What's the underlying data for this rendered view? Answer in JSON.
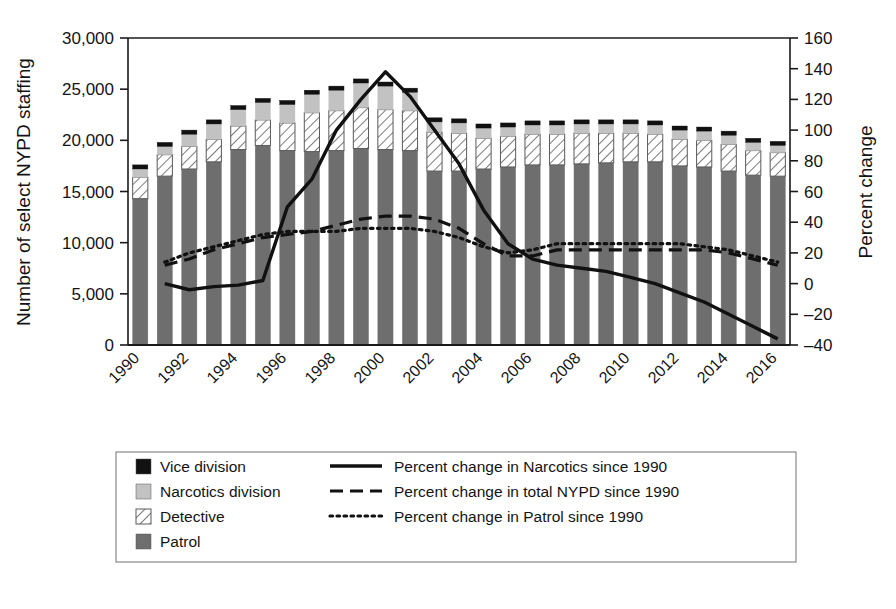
{
  "chart_data": {
    "type": "bar",
    "title": "",
    "subtitle": "",
    "ylabel": "Number of select NYPD staffing",
    "y2label": "Percent change",
    "xlabel": "",
    "ylim": [
      0,
      30000
    ],
    "ytick_values": [
      0,
      5000,
      10000,
      15000,
      20000,
      25000,
      30000
    ],
    "ytick_labels": [
      "0",
      "5,000",
      "10,000",
      "15,000",
      "20,000",
      "25,000",
      "30,000"
    ],
    "y2lim": [
      -40,
      160
    ],
    "y2tick_values": [
      -40,
      -20,
      0,
      20,
      40,
      60,
      80,
      100,
      120,
      140,
      160
    ],
    "y2tick_labels": [
      "–40",
      "–20",
      "0",
      "20",
      "40",
      "60",
      "80",
      "100",
      "120",
      "140",
      "160"
    ],
    "grid": false,
    "legend_position": "below",
    "categories": [
      1990,
      1991,
      1992,
      1993,
      1994,
      1995,
      1996,
      1997,
      1998,
      1999,
      2000,
      2001,
      2002,
      2003,
      2004,
      2005,
      2006,
      2007,
      2008,
      2009,
      2010,
      2011,
      2012,
      2013,
      2014,
      2015,
      2016
    ],
    "xtick_labels": [
      "1990",
      "1992",
      "1994",
      "1996",
      "1998",
      "2000",
      "2002",
      "2004",
      "2006",
      "2008",
      "2010",
      "2012",
      "2014",
      "2016"
    ],
    "stacked_series": [
      {
        "name": "Patrol",
        "key": "patrol",
        "fill": "#6e6e6e",
        "pattern": "solid",
        "values": [
          14300,
          16500,
          17200,
          17900,
          19100,
          19500,
          19000,
          18900,
          19000,
          19200,
          19100,
          19000,
          17000,
          17000,
          17200,
          17400,
          17600,
          17600,
          17700,
          17800,
          17900,
          17900,
          17500,
          17400,
          17000,
          16600,
          16500
        ]
      },
      {
        "name": "Detective",
        "key": "detective",
        "fill": "#ffffff",
        "pattern": "diagonal-hatch",
        "values": [
          2100,
          2100,
          2200,
          2200,
          2300,
          2500,
          2700,
          3800,
          3900,
          4000,
          3900,
          3900,
          3800,
          3700,
          3000,
          3000,
          3000,
          3000,
          3000,
          2900,
          2800,
          2700,
          2600,
          2600,
          2600,
          2400,
          2300
        ]
      },
      {
        "name": "Narcotics division",
        "key": "narcotics",
        "fill": "#c2c2c2",
        "pattern": "solid",
        "values": [
          800,
          800,
          1200,
          1500,
          1600,
          1700,
          1800,
          1800,
          2000,
          2400,
          2300,
          1800,
          1000,
          1000,
          1000,
          900,
          900,
          900,
          900,
          900,
          900,
          900,
          900,
          900,
          900,
          800,
          700
        ]
      },
      {
        "name": "Vice division",
        "key": "vice",
        "fill": "#111111",
        "pattern": "solid",
        "values": [
          400,
          400,
          400,
          400,
          400,
          400,
          400,
          400,
          400,
          400,
          400,
          400,
          400,
          400,
          400,
          400,
          400,
          400,
          400,
          400,
          400,
          400,
          400,
          400,
          400,
          400,
          400
        ]
      }
    ],
    "line_series": [
      {
        "name": "Percent change in Narcotics since 1990",
        "key": "narcotics_pct",
        "style": "solid",
        "axis": "right",
        "x": [
          1991,
          1992,
          1993,
          1994,
          1995,
          1996,
          1997,
          1998,
          1999,
          2000,
          2001,
          2002,
          2003,
          2004,
          2005,
          2006,
          2007,
          2008,
          2009,
          2010,
          2011,
          2012,
          2013,
          2014,
          2015,
          2016
        ],
        "values": [
          0,
          -4,
          -2,
          -1,
          2,
          50,
          68,
          100,
          120,
          138,
          122,
          100,
          78,
          48,
          26,
          16,
          12,
          10,
          8,
          4,
          0,
          -6,
          -12,
          -20,
          -28,
          -36
        ]
      },
      {
        "name": "Percent change in total NYPD since 1990",
        "key": "total_nypd_pct",
        "style": "dashed",
        "axis": "right",
        "x": [
          1991,
          1992,
          1993,
          1994,
          1995,
          1996,
          1997,
          1998,
          1999,
          2000,
          2001,
          2002,
          2003,
          2004,
          2005,
          2006,
          2007,
          2008,
          2009,
          2010,
          2011,
          2012,
          2013,
          2014,
          2015,
          2016
        ],
        "values": [
          12,
          16,
          22,
          26,
          30,
          32,
          34,
          38,
          42,
          44,
          44,
          42,
          36,
          26,
          18,
          18,
          22,
          22,
          22,
          22,
          22,
          22,
          22,
          20,
          16,
          12
        ]
      },
      {
        "name": "Percent change in Patrol since 1990",
        "key": "patrol_pct",
        "style": "dotted",
        "axis": "right",
        "x": [
          1991,
          1992,
          1993,
          1994,
          1995,
          1996,
          1997,
          1998,
          1999,
          2000,
          2001,
          2002,
          2003,
          2004,
          2005,
          2006,
          2007,
          2008,
          2009,
          2010,
          2011,
          2012,
          2013,
          2014,
          2015,
          2016
        ],
        "values": [
          14,
          20,
          24,
          28,
          32,
          34,
          34,
          34,
          36,
          36,
          36,
          34,
          30,
          24,
          20,
          22,
          26,
          26,
          26,
          26,
          26,
          26,
          24,
          22,
          18,
          14
        ]
      }
    ]
  },
  "legend": {
    "swatch_items": [
      {
        "label": "Vice division",
        "swatch": "vice-swatch",
        "color": "#111111"
      },
      {
        "label": "Narcotics division",
        "swatch": "narcotics-swatch",
        "color": "#c2c2c2"
      },
      {
        "label": "Detective",
        "swatch": "detective-swatch",
        "color": "#ffffff"
      },
      {
        "label": "Patrol",
        "swatch": "patrol-swatch",
        "color": "#6e6e6e"
      }
    ],
    "line_items": [
      {
        "label": "Percent change in Narcotics since 1990",
        "style": "solid"
      },
      {
        "label": "Percent change in total NYPD since 1990",
        "style": "dashed"
      },
      {
        "label": "Percent change in Patrol since 1990",
        "style": "dotted"
      }
    ]
  },
  "colors": {
    "patrol": "#6e6e6e",
    "narcotics": "#c2c2c2",
    "detective": "#ffffff",
    "vice": "#111111",
    "axis": "#1a1a1a",
    "background": "#ffffff"
  }
}
